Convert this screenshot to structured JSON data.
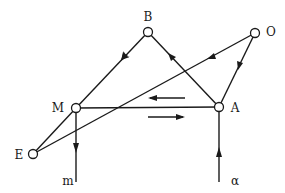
{
  "diagram": {
    "nodes": [
      {
        "id": "B",
        "label": "B",
        "x": 148,
        "y": 32
      },
      {
        "id": "O",
        "label": "O",
        "x": 255,
        "y": 33
      },
      {
        "id": "M",
        "label": "M",
        "x": 76,
        "y": 108
      },
      {
        "id": "A",
        "label": "A",
        "x": 219,
        "y": 107
      },
      {
        "id": "E",
        "label": "E",
        "x": 33,
        "y": 154
      }
    ],
    "edges": [
      {
        "from": "B",
        "to": "M",
        "arrow": "toward M"
      },
      {
        "from": "A",
        "to": "B",
        "arrow": "toward B"
      },
      {
        "from": "O",
        "to": "E",
        "arrow": "toward E"
      },
      {
        "from": "O",
        "to": "A",
        "arrow": "toward A"
      },
      {
        "from": "M",
        "to": "A",
        "arrow": "none"
      },
      {
        "from": "M",
        "to": "E",
        "arrow": "none"
      }
    ],
    "terminals": [
      {
        "label": "m",
        "from": "M",
        "direction": "down (output)"
      },
      {
        "label": "α",
        "to": "A",
        "direction": "up (input)"
      }
    ],
    "flow_arrows": [
      {
        "direction": "left",
        "position": "above M–A"
      },
      {
        "direction": "right",
        "position": "below M–A"
      }
    ],
    "labels": {
      "B": "B",
      "O": "O",
      "M": "M",
      "A": "A",
      "E": "E",
      "m": "m",
      "alpha": "α"
    }
  }
}
